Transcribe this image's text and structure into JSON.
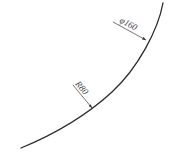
{
  "diagram": {
    "type": "engineering-arc-drawing",
    "colors": {
      "background": "#ffffff",
      "curve": "#2a2a2a",
      "leader": "#3a3a3a",
      "text": "#3a3a3a"
    },
    "curve": {
      "description": "Arc curving from top-right to bottom-left",
      "start": [
        163,
        3
      ],
      "end": [
        21,
        148
      ]
    },
    "dimensions": [
      {
        "label": "φ160",
        "kind": "diameter",
        "leader_start": [
          113,
          22
        ],
        "arrow_tip": [
          146,
          40
        ],
        "text_pos": [
          119,
          23
        ],
        "text_rotation_deg": 28
      },
      {
        "label": "R80",
        "kind": "radius",
        "leader_start": [
          73,
          85
        ],
        "arrow_tip": [
          92,
          108
        ],
        "text_pos": [
          75,
          86
        ],
        "text_rotation_deg": 50
      }
    ]
  }
}
